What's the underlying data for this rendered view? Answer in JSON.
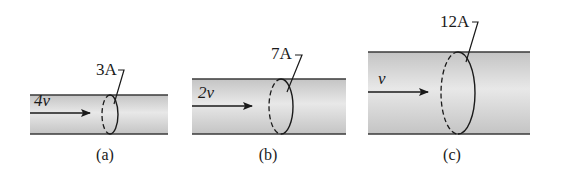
{
  "figure": {
    "colors": {
      "pipe_fill_edge": "#c8c8c8",
      "pipe_fill_center": "#e6e6e6",
      "pipe_border": "#3a3a3a",
      "ink": "#1a1a1a"
    },
    "panels": [
      {
        "id": "a",
        "caption": "(a)",
        "current_label": "3A",
        "velocity_label": "4v",
        "pipe": {
          "x": 30,
          "y": 95,
          "w": 138,
          "h": 39
        },
        "arrow": {
          "x1": 30,
          "x2": 90,
          "y": 113
        },
        "velocity_pos": {
          "x": 34,
          "y": 106
        },
        "loop": {
          "cx": 110,
          "cy": 114.5,
          "rx": 8,
          "ry": 19.5
        },
        "leader": {
          "sx": 114,
          "sy": 104,
          "ex": 124,
          "ey": 70,
          "tx": 118
        },
        "current_pos": {
          "x": 96,
          "y": 75
        },
        "caption_pos": {
          "x": 105,
          "y": 160
        }
      },
      {
        "id": "b",
        "caption": "(b)",
        "current_label": "7A",
        "velocity_label": "2v",
        "pipe": {
          "x": 192,
          "y": 79,
          "w": 154,
          "h": 55
        },
        "arrow": {
          "x1": 192,
          "x2": 252,
          "y": 106
        },
        "velocity_pos": {
          "x": 198,
          "y": 98
        },
        "loop": {
          "cx": 281,
          "cy": 106.5,
          "rx": 12,
          "ry": 27.5
        },
        "leader": {
          "sx": 287,
          "sy": 92,
          "ex": 302,
          "ey": 55,
          "tx": 295
        },
        "current_pos": {
          "x": 271,
          "y": 59
        },
        "caption_pos": {
          "x": 268,
          "y": 160
        }
      },
      {
        "id": "c",
        "caption": "(c)",
        "current_label": "12A",
        "velocity_label": "v",
        "pipe": {
          "x": 368,
          "y": 52,
          "w": 162,
          "h": 82
        },
        "arrow": {
          "x1": 368,
          "x2": 428,
          "y": 92
        },
        "velocity_pos": {
          "x": 378,
          "y": 84
        },
        "loop": {
          "cx": 458,
          "cy": 93,
          "rx": 17,
          "ry": 41
        },
        "leader": {
          "sx": 466,
          "sy": 62,
          "ex": 478,
          "ey": 22,
          "tx": 472
        },
        "current_pos": {
          "x": 440,
          "y": 27
        },
        "caption_pos": {
          "x": 452,
          "y": 160
        }
      }
    ]
  }
}
